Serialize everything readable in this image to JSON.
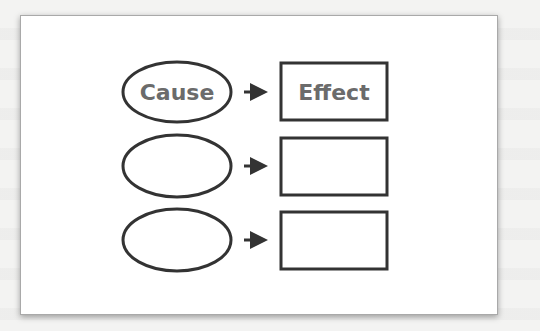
{
  "diagram": {
    "colors": {
      "stroke": "#333333",
      "label": "#6b6b6b",
      "card_bg": "#ffffff",
      "page_bg": "#f3f3f2"
    },
    "rows": [
      {
        "cause": "Cause",
        "effect": "Effect"
      },
      {
        "cause": "",
        "effect": ""
      },
      {
        "cause": "",
        "effect": ""
      }
    ]
  }
}
